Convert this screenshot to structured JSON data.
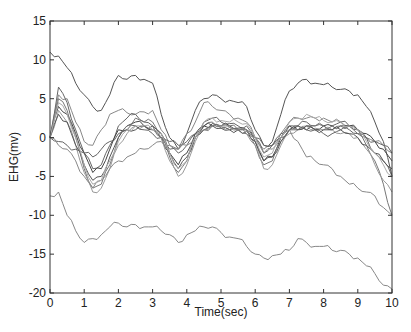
{
  "chart_data": {
    "type": "line",
    "title": "",
    "xlabel": "Time(sec)",
    "ylabel": "EHG(mv)",
    "xlim": [
      0,
      10
    ],
    "ylim": [
      -20,
      15
    ],
    "xticks": [
      0,
      1,
      2,
      3,
      4,
      5,
      6,
      7,
      8,
      9,
      10
    ],
    "yticks": [
      15,
      10,
      5,
      0,
      -5,
      -10,
      -15,
      -20
    ],
    "grid": false,
    "legend": null,
    "x": [
      0,
      0.25,
      0.5,
      0.75,
      1,
      1.25,
      1.5,
      1.75,
      2,
      2.25,
      2.5,
      2.75,
      3,
      3.25,
      3.5,
      3.75,
      4,
      4.25,
      4.5,
      4.75,
      5,
      5.25,
      5.5,
      5.75,
      6,
      6.25,
      6.5,
      6.75,
      7,
      7.25,
      7.5,
      7.75,
      8,
      8.25,
      8.5,
      8.75,
      9,
      9.25,
      9.5,
      9.75,
      10
    ],
    "series": [
      {
        "name": "trace-1",
        "color": "#555555",
        "values": [
          11,
          10.5,
          9,
          7,
          5.5,
          4,
          3.5,
          5.5,
          8,
          7.5,
          8,
          7.5,
          7,
          3,
          0,
          -1.5,
          0.5,
          3.5,
          5,
          5.5,
          5,
          4.8,
          4.5,
          4,
          1,
          -1,
          -0.5,
          3,
          6,
          7,
          7.5,
          7,
          6.8,
          6.5,
          6.2,
          6,
          5.5,
          4,
          2,
          -0.5,
          -5
        ]
      },
      {
        "name": "trace-2",
        "color": "#888888",
        "values": [
          0,
          5.5,
          5,
          2,
          -0.5,
          -1,
          1,
          3,
          3.5,
          3.2,
          3,
          3.3,
          3.5,
          1,
          -1,
          -1.5,
          0.5,
          2,
          4.5,
          4,
          3.5,
          3,
          2.5,
          2,
          0,
          -1.5,
          -1,
          0.5,
          2,
          2.5,
          2.5,
          2.5,
          2.5,
          2,
          2,
          1.5,
          1,
          0,
          -0.5,
          -1,
          -2
        ]
      },
      {
        "name": "trace-3",
        "color": "#666666",
        "values": [
          0,
          6.5,
          4.5,
          1,
          -2,
          -4,
          -3.5,
          -1,
          1.5,
          2.5,
          3,
          2,
          1.5,
          0,
          -1.5,
          -2,
          -1,
          0.5,
          2,
          2.5,
          2,
          1.8,
          1.5,
          1.5,
          0,
          -2,
          -1,
          0.5,
          1.5,
          1.5,
          2,
          1.5,
          1.5,
          1.5,
          2,
          1.5,
          1,
          0,
          -2,
          -3,
          -5
        ]
      },
      {
        "name": "trace-4",
        "color": "#444444",
        "values": [
          0,
          4,
          3,
          0.5,
          -2,
          -4.5,
          -4,
          -1.5,
          1,
          1.5,
          2,
          1.5,
          1,
          0,
          -2,
          -3.5,
          -2,
          0.5,
          1.5,
          1.8,
          1.5,
          1.5,
          1.2,
          1,
          -0.5,
          -3,
          -2.5,
          0,
          1.5,
          1.5,
          1,
          1,
          1.5,
          1.5,
          1.5,
          1.5,
          1,
          0.5,
          -0.5,
          -1.5,
          -3
        ]
      },
      {
        "name": "trace-5",
        "color": "#777777",
        "values": [
          0,
          5,
          3.5,
          0,
          -4,
          -6.5,
          -6,
          -3.5,
          0,
          1.5,
          2.5,
          2,
          2,
          0.5,
          -2.5,
          -4.5,
          -3,
          0,
          1.5,
          2,
          1.5,
          1.5,
          1,
          0.5,
          -1,
          -3.5,
          -3,
          -0.5,
          1,
          1.5,
          1.5,
          1.5,
          1.5,
          1,
          1.5,
          1.5,
          0.5,
          -1,
          -3,
          -6,
          -10
        ]
      },
      {
        "name": "trace-6",
        "color": "#999999",
        "values": [
          0,
          3.5,
          2,
          -1,
          -4.5,
          -7,
          -6.5,
          -4,
          -1,
          0.5,
          1.5,
          1.5,
          1,
          0,
          -3,
          -5,
          -3.5,
          -0.5,
          1,
          1.5,
          1.5,
          1.3,
          1,
          0.5,
          -1,
          -4,
          -3.5,
          -1,
          0.5,
          1,
          1.5,
          1.2,
          1,
          1,
          0.5,
          0.5,
          0,
          -1.5,
          -3.5,
          -5.5,
          -7
        ]
      },
      {
        "name": "trace-7",
        "color": "#555555",
        "values": [
          0,
          3,
          2,
          -1,
          -3.5,
          -5.5,
          -5,
          -2.5,
          0,
          1,
          1,
          1.5,
          1.5,
          0.5,
          -2,
          -4,
          -2.5,
          0,
          1.5,
          1.5,
          1.2,
          1,
          1,
          1,
          -0.5,
          -3,
          -2.5,
          -0.5,
          1,
          1,
          1.5,
          1,
          1,
          1,
          1,
          0.5,
          0,
          -1,
          -2,
          -3,
          -4
        ]
      },
      {
        "name": "trace-8",
        "color": "#666666",
        "values": [
          0,
          -0.5,
          -1,
          -1.5,
          -2,
          -2.5,
          -1.5,
          -0.5,
          0.5,
          1,
          1.5,
          1,
          0.5,
          0,
          -0.5,
          -1,
          -0.5,
          0.5,
          1,
          1.5,
          1.2,
          1,
          1,
          0.8,
          0,
          -1,
          -1,
          0,
          1,
          1,
          1,
          1,
          0.5,
          0.5,
          1,
          1,
          0.5,
          0,
          -0.5,
          -1,
          -2
        ]
      },
      {
        "name": "trace-9",
        "color": "#888888",
        "values": [
          0,
          -1,
          -1.5,
          -3,
          -5,
          -6.5,
          -5.5,
          -4,
          -3,
          -2.5,
          -2,
          -1.5,
          -1,
          -0.5,
          -1,
          -1.5,
          -1,
          0,
          1,
          1.5,
          1.5,
          1.3,
          1,
          1,
          0,
          -2,
          -1.5,
          0,
          1,
          -0.5,
          -2.5,
          -3,
          -3.5,
          -4,
          -5,
          -6,
          -6.5,
          -7,
          -7.5,
          -9,
          -10
        ]
      },
      {
        "name": "trace-10",
        "color": "#aaaaaa",
        "values": [
          0,
          4.5,
          3,
          0,
          -3.5,
          -6,
          -5.5,
          -3,
          -0.5,
          1,
          1.5,
          1.5,
          1,
          0.5,
          -2,
          -4,
          -3,
          0,
          2,
          2.5,
          2.2,
          2,
          2,
          1.8,
          0,
          -2.5,
          -2,
          0,
          2,
          2.5,
          3,
          2.5,
          2.2,
          2,
          2,
          1.5,
          1,
          -0.5,
          -2,
          -3.5,
          -5
        ]
      },
      {
        "name": "trace-11",
        "color": "#888888",
        "values": [
          -7.5,
          -7,
          -10,
          -12,
          -13.5,
          -13,
          -12.5,
          -11.5,
          -11,
          -11.5,
          -11.2,
          -11.5,
          -11.5,
          -12,
          -12.5,
          -13.5,
          -12.5,
          -12,
          -11.5,
          -11.5,
          -12.2,
          -12.8,
          -13,
          -14,
          -15,
          -15.5,
          -15.2,
          -15,
          -14.5,
          -13,
          -13.5,
          -14,
          -14,
          -14.5,
          -14.5,
          -15,
          -15.5,
          -16.5,
          -17.5,
          -19,
          -19.5
        ]
      }
    ]
  },
  "axes": {
    "xlabel": "Time(sec)",
    "ylabel": "EHG(mv)",
    "xtick_labels": [
      "0",
      "1",
      "2",
      "3",
      "4",
      "5",
      "6",
      "7",
      "8",
      "9",
      "10"
    ],
    "ytick_labels": [
      "15",
      "10",
      "5",
      "0",
      "-5",
      "-10",
      "-15",
      "-20"
    ]
  }
}
